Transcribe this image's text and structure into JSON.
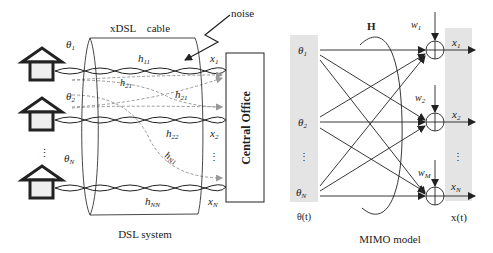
{
  "dsl_system": {
    "caption": "DSL system",
    "cable_label": "xDSL    cable",
    "noise_label": "noise",
    "central_office_label": "Central Office",
    "theta_labels": [
      {
        "base": "θ",
        "sub": "1"
      },
      {
        "base": "θ",
        "sub": "2"
      },
      {
        "base": "θ",
        "sub": "N"
      }
    ],
    "x_labels": [
      {
        "base": "x",
        "sub": "1"
      },
      {
        "base": "x",
        "sub": "2"
      },
      {
        "base": "x",
        "sub": "N"
      }
    ],
    "channel_labels": {
      "h11": {
        "base": "h",
        "sub": "11"
      },
      "h12": {
        "base": "h",
        "sub": "21"
      },
      "h21": {
        "base": "h",
        "sub": "21"
      },
      "h22": {
        "base": "h",
        "sub": "22"
      },
      "hN1": {
        "base": "h",
        "sub": "N1"
      },
      "hNN": {
        "base": "h",
        "sub": "NN"
      }
    },
    "ellipsis": "⋮"
  },
  "mimo_model": {
    "caption": "MIMO model",
    "matrix_label": "H",
    "input_vector_label": "θ(t)",
    "output_vector_label": "x(t)",
    "theta_labels": [
      {
        "base": "θ",
        "sub": "1"
      },
      {
        "base": "θ",
        "sub": "2"
      },
      {
        "base": "θ",
        "sub": "N"
      }
    ],
    "x_labels": [
      {
        "base": "x",
        "sub": "1"
      },
      {
        "base": "x",
        "sub": "2"
      },
      {
        "base": "x",
        "sub": "N"
      }
    ],
    "w_labels": [
      {
        "base": "w",
        "sub": "1"
      },
      {
        "base": "w",
        "sub": "2"
      },
      {
        "base": "w",
        "sub": "M"
      }
    ],
    "ellipsis": "⋮"
  },
  "colors": {
    "line": "#222222",
    "dashed": "#999999",
    "panel": "#e4e4e4",
    "house_fill": "#eeeeee"
  }
}
